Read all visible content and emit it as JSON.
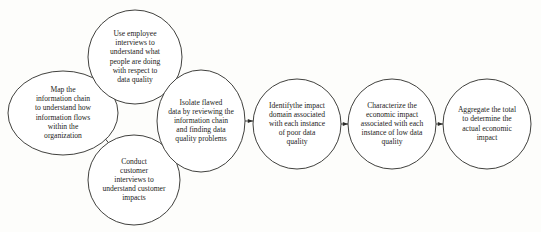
{
  "diagram": {
    "type": "flow-diagram",
    "background_color": "#fdfdfb",
    "stroke_color": "#2b2b28",
    "text_color": "#1d1c1a",
    "nodes": [
      {
        "id": "map-information-chain",
        "shape": "ellipse",
        "cx": 63,
        "cy": 113,
        "rx": 55,
        "ry": 42,
        "font_size": 7.6,
        "line_height": 9.2,
        "lines": [
          "Map the",
          "information chain",
          "to understand how",
          "information flows",
          "within the",
          "organization"
        ],
        "text": "Map the information chain to understand how information flows within the organization"
      },
      {
        "id": "use-employee-interviews",
        "shape": "ellipse",
        "cx": 135,
        "cy": 57,
        "rx": 47,
        "ry": 47,
        "font_size": 7.6,
        "line_height": 9.2,
        "lines": [
          "Use employee",
          "interviews to",
          "understand what",
          "people are doing",
          "with respect to",
          "data quality"
        ],
        "text": "Use employee interviews to understand what people are doing with respect to data quality"
      },
      {
        "id": "conduct-customer-interviews",
        "shape": "ellipse",
        "cx": 134,
        "cy": 180,
        "rx": 46,
        "ry": 45,
        "font_size": 7.6,
        "line_height": 9.2,
        "lines": [
          "Conduct",
          "customer",
          "interviews  to",
          "understand customer",
          "impacts"
        ],
        "text": "Conduct customer interviews to understand customer impacts"
      },
      {
        "id": "isolate-flawed-data",
        "shape": "ellipse",
        "cx": 201,
        "cy": 121,
        "rx": 44,
        "ry": 51,
        "font_size": 7.6,
        "line_height": 9.2,
        "lines": [
          "Isolate flawed",
          "data by reviewing the",
          "information chain",
          "and finding  data",
          "quality problems"
        ],
        "text": "Isolate flawed data by reviewing the information chain and finding data quality problems"
      },
      {
        "id": "identify-impact-domain",
        "shape": "ellipse",
        "cx": 297,
        "cy": 124,
        "rx": 44,
        "ry": 45,
        "font_size": 7.6,
        "line_height": 9.2,
        "lines": [
          "Identifythe impact",
          "domain associated",
          "with each instance",
          "of poor data",
          "quality"
        ],
        "text": "Identifythe impact domain associated with each instance of poor data quality"
      },
      {
        "id": "characterize-economic-impact",
        "shape": "ellipse",
        "cx": 392,
        "cy": 124,
        "rx": 44,
        "ry": 45,
        "font_size": 7.6,
        "line_height": 9.2,
        "lines": [
          "Characterize the",
          "economic impact",
          "associated with each",
          "instance of low data",
          "quality"
        ],
        "text": "Characterize the economic impact associated with each instance of low data quality"
      },
      {
        "id": "aggregate-total",
        "shape": "ellipse",
        "cx": 487,
        "cy": 124,
        "rx": 44,
        "ry": 45,
        "font_size": 7.6,
        "line_height": 9.2,
        "lines": [
          "Aggregate the total",
          "to determine the",
          "actual economic",
          "impact"
        ],
        "text": "Aggregate the total to determine the actual economic impact"
      }
    ],
    "connectors": [
      {
        "id": "map-to-employee",
        "from": "map-information-chain",
        "to": "use-employee-interviews",
        "style": "curved",
        "path": "M 104 95 C 109 90 112 86 116 80"
      },
      {
        "id": "employee-to-isolate",
        "from": "use-employee-interviews",
        "to": "isolate-flawed-data",
        "style": "curved",
        "path": "M 165 83 C 171 89 176 94 182 100"
      },
      {
        "id": "map-to-customer",
        "from": "map-information-chain",
        "to": "conduct-customer-interviews",
        "style": "curved",
        "path": "M 103 136 C 107 141 111 146 116 151"
      },
      {
        "id": "customer-to-isolate",
        "from": "conduct-customer-interviews",
        "to": "isolate-flawed-data",
        "style": "curved",
        "path": "M 163 160 C 169 155 174 150 180 144"
      },
      {
        "id": "isolate-to-identify",
        "from": "isolate-flawed-data",
        "to": "identify-impact-domain",
        "style": "straight",
        "path": "M 245 121 L 253 121"
      },
      {
        "id": "identify-to-characterize",
        "from": "identify-impact-domain",
        "to": "characterize-economic-impact",
        "style": "straight",
        "path": "M 341 124 L 348 124"
      },
      {
        "id": "characterize-to-aggregate",
        "from": "characterize-economic-impact",
        "to": "aggregate-total",
        "style": "straight",
        "path": "M 436 124 L 443 124"
      }
    ]
  }
}
